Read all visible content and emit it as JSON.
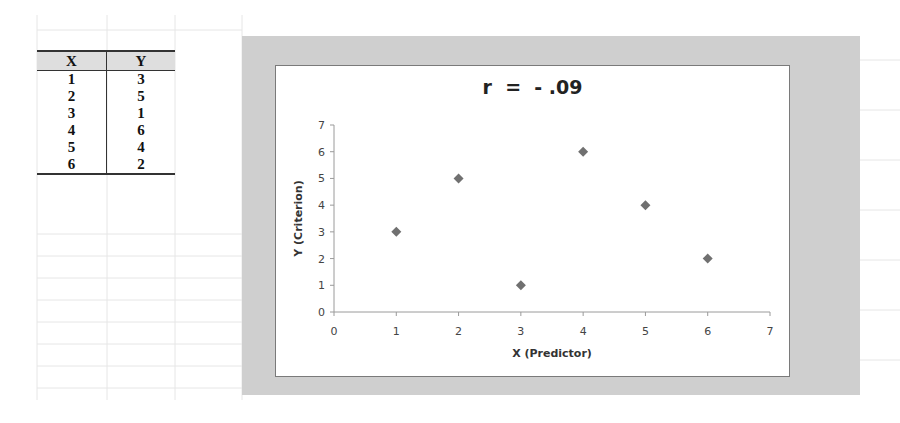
{
  "table": {
    "headers": [
      "X",
      "Y"
    ],
    "rows": [
      [
        "1",
        "3"
      ],
      [
        "2",
        "5"
      ],
      [
        "3",
        "1"
      ],
      [
        "4",
        "6"
      ],
      [
        "5",
        "4"
      ],
      [
        "6",
        "2"
      ]
    ]
  },
  "chart": {
    "title": "r  =  - .09",
    "xlabel": "X (Predictor)",
    "ylabel": "Y (Criterion)",
    "marker_color": "#707070"
  },
  "chart_data": {
    "type": "scatter",
    "title": "r = - .09",
    "xlabel": "X (Predictor)",
    "ylabel": "Y (Criterion)",
    "x": [
      1,
      2,
      3,
      4,
      5,
      6
    ],
    "y": [
      3,
      5,
      1,
      6,
      4,
      2
    ],
    "xlim": [
      0,
      7
    ],
    "ylim": [
      0,
      7
    ],
    "xticks": [
      0,
      1,
      2,
      3,
      4,
      5,
      6,
      7
    ],
    "yticks": [
      0,
      1,
      2,
      3,
      4,
      5,
      6,
      7
    ],
    "grid": false,
    "legend": null,
    "marker": "diamond"
  }
}
